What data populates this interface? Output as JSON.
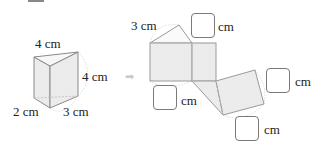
{
  "prism": {
    "label_top": "4 cm",
    "label_height": "4 cm",
    "label_bottom_left": "2 cm",
    "label_bottom_right": "3 cm"
  },
  "arrow": {
    "icon": "arrow-right-icon",
    "glyph": "➡"
  },
  "net": {
    "label_triangle_side": "3 cm",
    "answer_boxes": [
      {
        "unit": "cm",
        "position": "top"
      },
      {
        "unit": "cm",
        "position": "left-bottom"
      },
      {
        "unit": "cm",
        "position": "right"
      },
      {
        "unit": "cm",
        "position": "bottom"
      }
    ]
  },
  "colors": {
    "line": "#9a9a9a",
    "fill": "#ececec",
    "dotted": "#c8c8c8",
    "text": "#222222"
  }
}
